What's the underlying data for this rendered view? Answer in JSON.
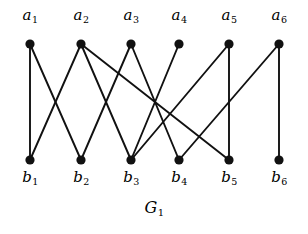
{
  "figure": {
    "caption_letter": "G",
    "caption_sub": "1",
    "caption_full": "G1",
    "background_color": "#ffffff",
    "ink_color": "#000000"
  },
  "graph": {
    "type": "bipartite-graph",
    "edge_color": "#111111",
    "edge_width": 1.9,
    "node_color": "#111111",
    "node_radius": 4.6,
    "top_row_y": 44,
    "bottom_row_y": 160,
    "top_label_y": 8,
    "bottom_label_y": 170,
    "caption_x": 154,
    "caption_y": 200,
    "top_nodes": [
      {
        "id": "a1",
        "letter": "a",
        "sub": "1",
        "x": 30,
        "y": 44
      },
      {
        "id": "a2",
        "letter": "a",
        "sub": "2",
        "x": 81,
        "y": 44
      },
      {
        "id": "a3",
        "letter": "a",
        "sub": "3",
        "x": 131,
        "y": 44
      },
      {
        "id": "a4",
        "letter": "a",
        "sub": "4",
        "x": 179,
        "y": 44
      },
      {
        "id": "a5",
        "letter": "a",
        "sub": "5",
        "x": 229,
        "y": 44
      },
      {
        "id": "a6",
        "letter": "a",
        "sub": "6",
        "x": 279,
        "y": 44
      }
    ],
    "bottom_nodes": [
      {
        "id": "b1",
        "letter": "b",
        "sub": "1",
        "x": 30,
        "y": 160
      },
      {
        "id": "b2",
        "letter": "b",
        "sub": "2",
        "x": 81,
        "y": 160
      },
      {
        "id": "b3",
        "letter": "b",
        "sub": "3",
        "x": 131,
        "y": 160
      },
      {
        "id": "b4",
        "letter": "b",
        "sub": "4",
        "x": 179,
        "y": 160
      },
      {
        "id": "b5",
        "letter": "b",
        "sub": "5",
        "x": 229,
        "y": 160
      },
      {
        "id": "b6",
        "letter": "b",
        "sub": "6",
        "x": 279,
        "y": 160
      }
    ],
    "edges": [
      {
        "from": "a1",
        "to": "b1",
        "x1": 30,
        "y1": 44,
        "x2": 30,
        "y2": 160
      },
      {
        "from": "a1",
        "to": "b2",
        "x1": 30,
        "y1": 44,
        "x2": 81,
        "y2": 160
      },
      {
        "from": "a2",
        "to": "b1",
        "x1": 81,
        "y1": 44,
        "x2": 30,
        "y2": 160
      },
      {
        "from": "a2",
        "to": "b3",
        "x1": 81,
        "y1": 44,
        "x2": 131,
        "y2": 160
      },
      {
        "from": "a2",
        "to": "b5",
        "x1": 81,
        "y1": 44,
        "x2": 229,
        "y2": 160
      },
      {
        "from": "a3",
        "to": "b2",
        "x1": 131,
        "y1": 44,
        "x2": 81,
        "y2": 160
      },
      {
        "from": "a3",
        "to": "b4",
        "x1": 131,
        "y1": 44,
        "x2": 179,
        "y2": 160
      },
      {
        "from": "a4",
        "to": "b3",
        "x1": 179,
        "y1": 44,
        "x2": 131,
        "y2": 160
      },
      {
        "from": "a5",
        "to": "b3",
        "x1": 229,
        "y1": 44,
        "x2": 131,
        "y2": 160
      },
      {
        "from": "a5",
        "to": "b5",
        "x1": 229,
        "y1": 44,
        "x2": 229,
        "y2": 160
      },
      {
        "from": "a6",
        "to": "b4",
        "x1": 279,
        "y1": 44,
        "x2": 179,
        "y2": 160
      },
      {
        "from": "a6",
        "to": "b6",
        "x1": 279,
        "y1": 44,
        "x2": 279,
        "y2": 160
      }
    ]
  }
}
